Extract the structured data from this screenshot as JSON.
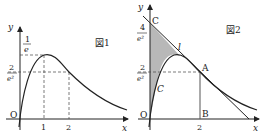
{
  "figure1": {
    "title": "図1",
    "axis_x": "x",
    "axis_y": "y",
    "origin": "O",
    "y_label_top_num": "1",
    "y_label_top_den": "e",
    "y_label_mid_num": "2",
    "y_label_mid_den": "e²",
    "x_tick_1": "1",
    "x_tick_2": "2"
  },
  "figure2": {
    "title": "図2",
    "axis_x": "x",
    "axis_y": "y",
    "origin": "O",
    "y_label_top_num": "4",
    "y_label_top_den": "e²",
    "y_label_mid_num": "2",
    "y_label_mid_den": "e²",
    "x_tick_2": "2",
    "point_C": "C",
    "point_A": "A",
    "point_B": "B",
    "curve_label": "C",
    "line_label": "l",
    "shade_color": "#b8b8b8"
  }
}
